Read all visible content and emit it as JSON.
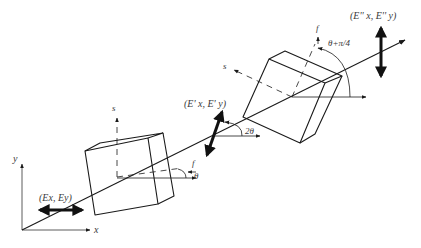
{
  "diagram": {
    "type": "optical polarization through two birefringent plates",
    "axes": {
      "x_label": "x",
      "y_label": "y"
    },
    "input_field": {
      "label": "(Ex, Ey)",
      "polarization": "horizontal"
    },
    "plate1": {
      "fast_axis_label": "f",
      "slow_axis_label": "s",
      "angle_label": "θ"
    },
    "intermediate_field": {
      "label": "(E' x, E' y)",
      "angle_label": "2θ",
      "polarization": "tilted"
    },
    "plate2": {
      "fast_axis_label": "f",
      "slow_axis_label": "s",
      "angle_label": "θ+π/4"
    },
    "output_field": {
      "label": "(E'' x, E'' y)",
      "polarization": "vertical"
    },
    "colors": {
      "line": "#1a1a1a",
      "arrow_fill": "#111111",
      "text": "#3a3a3a"
    }
  }
}
